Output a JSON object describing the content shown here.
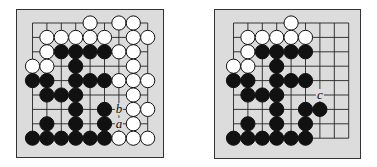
{
  "figure": {
    "grid": {
      "size": 9,
      "spacing": 14.4
    },
    "boards": [
      {
        "id": "left",
        "left": 16,
        "top": 9,
        "width": 148,
        "height": 149,
        "origin": {
          "x": 17,
          "y": 14.5
        },
        "stones": [
          {
            "c": "w",
            "x": 4,
            "y": 0
          },
          {
            "c": "w",
            "x": 6,
            "y": 0
          },
          {
            "c": "w",
            "x": 7,
            "y": 0
          },
          {
            "c": "w",
            "x": 1,
            "y": 1
          },
          {
            "c": "w",
            "x": 2,
            "y": 1
          },
          {
            "c": "w",
            "x": 3,
            "y": 1
          },
          {
            "c": "w",
            "x": 4,
            "y": 1
          },
          {
            "c": "w",
            "x": 5,
            "y": 1
          },
          {
            "c": "w",
            "x": 7,
            "y": 1
          },
          {
            "c": "w",
            "x": 8,
            "y": 1
          },
          {
            "c": "w",
            "x": 1,
            "y": 2
          },
          {
            "c": "b",
            "x": 2,
            "y": 2
          },
          {
            "c": "b",
            "x": 3,
            "y": 2
          },
          {
            "c": "b",
            "x": 4,
            "y": 2
          },
          {
            "c": "b",
            "x": 5,
            "y": 2
          },
          {
            "c": "w",
            "x": 6,
            "y": 2
          },
          {
            "c": "w",
            "x": 7,
            "y": 2
          },
          {
            "c": "w",
            "x": 0,
            "y": 3
          },
          {
            "c": "w",
            "x": 1,
            "y": 3
          },
          {
            "c": "b",
            "x": 3,
            "y": 3
          },
          {
            "c": "w",
            "x": 7,
            "y": 3
          },
          {
            "c": "b",
            "x": 0,
            "y": 4
          },
          {
            "c": "b",
            "x": 1,
            "y": 4
          },
          {
            "c": "b",
            "x": 3,
            "y": 4
          },
          {
            "c": "b",
            "x": 4,
            "y": 4
          },
          {
            "c": "b",
            "x": 5,
            "y": 4
          },
          {
            "c": "w",
            "x": 6,
            "y": 4
          },
          {
            "c": "w",
            "x": 7,
            "y": 4
          },
          {
            "c": "w",
            "x": 8,
            "y": 4
          },
          {
            "c": "b",
            "x": 1,
            "y": 5
          },
          {
            "c": "b",
            "x": 2,
            "y": 5
          },
          {
            "c": "b",
            "x": 3,
            "y": 5
          },
          {
            "c": "w",
            "x": 7,
            "y": 5
          },
          {
            "c": "b",
            "x": 3,
            "y": 6
          },
          {
            "c": "b",
            "x": 5,
            "y": 6
          },
          {
            "c": "w",
            "x": 7,
            "y": 6
          },
          {
            "c": "w",
            "x": 8,
            "y": 6
          },
          {
            "c": "b",
            "x": 1,
            "y": 7
          },
          {
            "c": "b",
            "x": 3,
            "y": 7
          },
          {
            "c": "b",
            "x": 5,
            "y": 7
          },
          {
            "c": "w",
            "x": 7,
            "y": 7
          },
          {
            "c": "b",
            "x": 0,
            "y": 8
          },
          {
            "c": "b",
            "x": 1,
            "y": 8
          },
          {
            "c": "b",
            "x": 2,
            "y": 8
          },
          {
            "c": "b",
            "x": 3,
            "y": 8
          },
          {
            "c": "b",
            "x": 4,
            "y": 8
          },
          {
            "c": "b",
            "x": 5,
            "y": 8
          },
          {
            "c": "w",
            "x": 6,
            "y": 8
          },
          {
            "c": "w",
            "x": 7,
            "y": 8
          },
          {
            "c": "w",
            "x": 8,
            "y": 8
          }
        ],
        "labels": [
          {
            "text": "b",
            "x": 6,
            "y": 6
          },
          {
            "text": "a",
            "x": 6,
            "y": 7
          }
        ]
      },
      {
        "id": "right",
        "left": 214,
        "top": 9,
        "width": 147,
        "height": 150,
        "origin": {
          "x": 20,
          "y": 14.5
        },
        "stones": [
          {
            "c": "w",
            "x": 4,
            "y": 0
          },
          {
            "c": "w",
            "x": 1,
            "y": 1
          },
          {
            "c": "w",
            "x": 2,
            "y": 1
          },
          {
            "c": "w",
            "x": 3,
            "y": 1
          },
          {
            "c": "w",
            "x": 4,
            "y": 1
          },
          {
            "c": "w",
            "x": 5,
            "y": 1
          },
          {
            "c": "w",
            "x": 1,
            "y": 2
          },
          {
            "c": "b",
            "x": 2,
            "y": 2
          },
          {
            "c": "b",
            "x": 3,
            "y": 2
          },
          {
            "c": "b",
            "x": 4,
            "y": 2
          },
          {
            "c": "b",
            "x": 5,
            "y": 2
          },
          {
            "c": "w",
            "x": 0,
            "y": 3
          },
          {
            "c": "w",
            "x": 1,
            "y": 3
          },
          {
            "c": "b",
            "x": 3,
            "y": 3
          },
          {
            "c": "b",
            "x": 0,
            "y": 4
          },
          {
            "c": "b",
            "x": 1,
            "y": 4
          },
          {
            "c": "b",
            "x": 3,
            "y": 4
          },
          {
            "c": "b",
            "x": 4,
            "y": 4
          },
          {
            "c": "b",
            "x": 5,
            "y": 4
          },
          {
            "c": "b",
            "x": 1,
            "y": 5
          },
          {
            "c": "b",
            "x": 2,
            "y": 5
          },
          {
            "c": "b",
            "x": 3,
            "y": 5
          },
          {
            "c": "b",
            "x": 3,
            "y": 6
          },
          {
            "c": "b",
            "x": 5,
            "y": 6
          },
          {
            "c": "b",
            "x": 6,
            "y": 6
          },
          {
            "c": "b",
            "x": 1,
            "y": 7
          },
          {
            "c": "b",
            "x": 3,
            "y": 7
          },
          {
            "c": "b",
            "x": 5,
            "y": 7
          },
          {
            "c": "b",
            "x": 0,
            "y": 8
          },
          {
            "c": "b",
            "x": 1,
            "y": 8
          },
          {
            "c": "b",
            "x": 2,
            "y": 8
          },
          {
            "c": "b",
            "x": 3,
            "y": 8
          },
          {
            "c": "b",
            "x": 4,
            "y": 8
          },
          {
            "c": "b",
            "x": 5,
            "y": 8
          }
        ],
        "labels": [
          {
            "text": "c",
            "x": 6,
            "y": 5
          }
        ]
      }
    ]
  }
}
